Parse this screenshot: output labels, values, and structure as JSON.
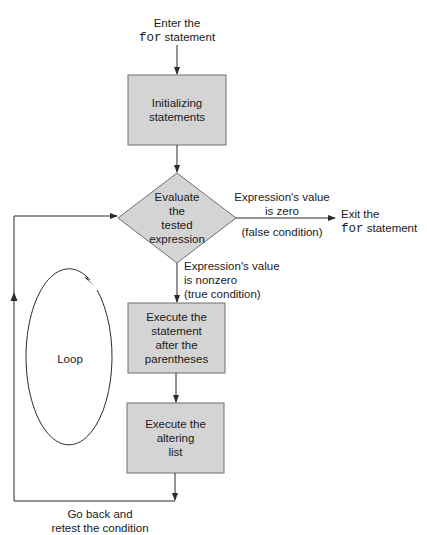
{
  "colors": {
    "box_fill": "#d4d4d4",
    "box_stroke": "#6f6f6f",
    "line": "#2b2b2b",
    "text": "#1a1a1a"
  },
  "entry": {
    "line1": "Enter the",
    "keyword": "for",
    "line2_rest": " statement"
  },
  "nodes": {
    "init": {
      "line1": "Initializing",
      "line2": "statements"
    },
    "decision": {
      "line1": "Evaluate",
      "line2": "the",
      "line3": "tested",
      "line4": "expression"
    },
    "body": {
      "line1": "Execute the",
      "line2": "statement",
      "line3": "after the",
      "line4": "parentheses"
    },
    "altering": {
      "line1": "Execute the",
      "line2": "altering",
      "line3": "list"
    }
  },
  "edges": {
    "false_branch": {
      "line1": "Expression's value",
      "line2": "is zero",
      "condition": "(false condition)"
    },
    "true_branch": {
      "line1": "Expression's value",
      "line2": "is nonzero",
      "condition": "(true condition)"
    },
    "loop_back": {
      "line1": "Go back and",
      "line2": "retest the condition"
    }
  },
  "exit": {
    "line1": "Exit the",
    "keyword": "for",
    "line2_rest": " statement"
  },
  "loop_label": "Loop"
}
